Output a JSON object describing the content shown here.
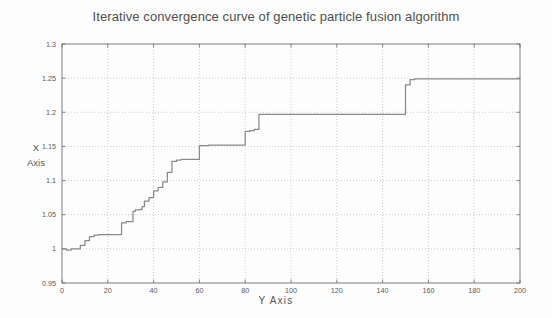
{
  "chart_data": {
    "type": "line",
    "title": "Iterative convergence curve of genetic particle fusion algorithm",
    "xlabel": "Y  Axis",
    "ylabel_line1": "X",
    "ylabel_line2": "Axis",
    "xlim": [
      0,
      200
    ],
    "ylim": [
      0.95,
      1.3
    ],
    "xticks": [
      0,
      20,
      40,
      60,
      80,
      100,
      120,
      140,
      160,
      180,
      200
    ],
    "xticklabels": [
      "0",
      "20",
      "40",
      "60",
      "80",
      "100",
      "120",
      "140",
      "160",
      "180",
      "200"
    ],
    "yticks": [
      0.95,
      1,
      1.05,
      1.1,
      1.15,
      1.2,
      1.25,
      1.3
    ],
    "yticklabels": [
      "0.95",
      "1",
      "1.05",
      "1.1",
      "1.15",
      "1.2",
      "1.25",
      "1.3"
    ],
    "grid": true,
    "grid_style": "dotted",
    "legend": null,
    "line_color": "#8a8a8a",
    "grid_color": "#b9b9b9",
    "axis_color": "#707070",
    "background_color": "#fdfdfd",
    "series": [
      {
        "name": "convergence",
        "step": "post",
        "x": [
          0,
          2,
          4,
          6,
          8,
          10,
          12,
          14,
          16,
          18,
          20,
          22,
          24,
          26,
          28,
          30,
          31,
          32,
          34,
          35,
          36,
          38,
          40,
          42,
          44,
          46,
          48,
          50,
          52,
          54,
          56,
          58,
          60,
          64,
          68,
          72,
          76,
          80,
          82,
          84,
          86,
          90,
          100,
          110,
          120,
          130,
          140,
          148,
          150,
          152,
          154,
          160,
          170,
          180,
          190,
          200
        ],
        "y": [
          1.0,
          0.998,
          1.0,
          1.0,
          1.005,
          1.012,
          1.018,
          1.02,
          1.021,
          1.021,
          1.021,
          1.021,
          1.021,
          1.038,
          1.04,
          1.04,
          1.055,
          1.057,
          1.058,
          1.062,
          1.07,
          1.075,
          1.085,
          1.09,
          1.098,
          1.112,
          1.128,
          1.13,
          1.131,
          1.131,
          1.131,
          1.131,
          1.151,
          1.152,
          1.152,
          1.152,
          1.152,
          1.172,
          1.173,
          1.175,
          1.197,
          1.197,
          1.197,
          1.197,
          1.197,
          1.197,
          1.197,
          1.197,
          1.24,
          1.248,
          1.249,
          1.249,
          1.249,
          1.249,
          1.249,
          1.249
        ]
      }
    ],
    "annotations": []
  }
}
